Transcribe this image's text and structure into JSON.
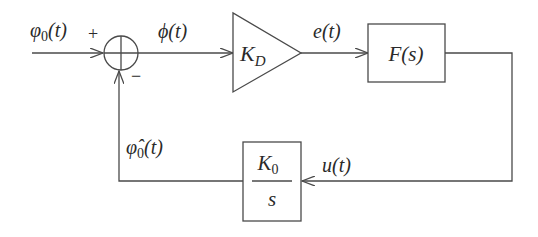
{
  "diagram": {
    "type": "block-diagram",
    "signals": {
      "input": {
        "base": "φ",
        "sub": "0",
        "arg": "(t)"
      },
      "error_phase": {
        "base": "ϕ",
        "arg": "(t)"
      },
      "detector_out": {
        "base": "e",
        "arg": "(t)"
      },
      "control": {
        "base": "u",
        "arg": "(t)"
      },
      "estimate": {
        "base": "φ̂",
        "sub": "0",
        "arg": "(t)"
      }
    },
    "summing_junction": {
      "plus_sign": "+",
      "minus_sign": "−"
    },
    "blocks": {
      "gain": {
        "base": "K",
        "sub": "D"
      },
      "filter": {
        "label": "F(s)"
      },
      "integrator": {
        "num_base": "K",
        "num_sub": "0",
        "den": "s"
      }
    },
    "colors": {
      "stroke": "#4a4a4a",
      "text": "#2a2a2a",
      "background": "#ffffff"
    }
  }
}
